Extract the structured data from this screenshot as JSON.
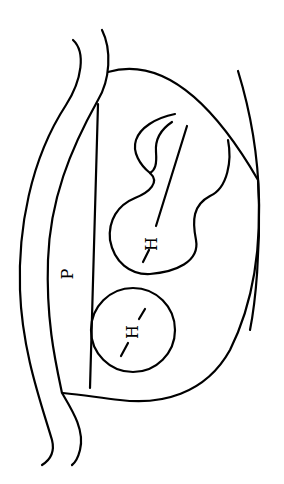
{
  "diagram": {
    "orientation": "rotated-90-ccw",
    "stroke_color": "#000000",
    "background": "#ffffff",
    "labels": {
      "p_label": "P",
      "h_upper": "H",
      "h_lower": "H"
    },
    "elements": [
      {
        "id": "outer-membrane-left",
        "type": "curve"
      },
      {
        "id": "outer-membrane-right",
        "type": "curve"
      },
      {
        "id": "enclosing-shape",
        "type": "closed-curve"
      },
      {
        "id": "p-line",
        "type": "line",
        "label": "P"
      },
      {
        "id": "lobed-body",
        "type": "closed-curve",
        "label": "H"
      },
      {
        "id": "round-body",
        "type": "circle",
        "label": "H"
      },
      {
        "id": "right-curve",
        "type": "curve"
      }
    ]
  }
}
